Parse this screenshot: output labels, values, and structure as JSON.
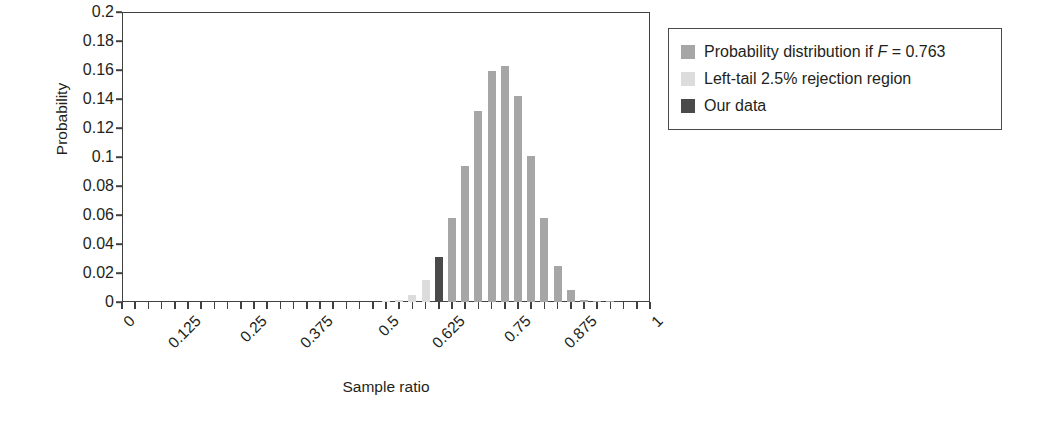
{
  "chart_data": {
    "type": "bar",
    "title": "",
    "xlabel": "Sample ratio",
    "ylabel": "Probability",
    "xlim": [
      0,
      1
    ],
    "ylim": [
      0,
      0.2
    ],
    "grid": false,
    "bar_width_ratio": 0.62,
    "x_tick_step": 0.025,
    "x_labeled_ticks": [
      "0",
      "0.125",
      "0.25",
      "0.375",
      "0.5",
      "0.625",
      "0.75",
      "0.875",
      "1"
    ],
    "x_labeled_values": [
      0,
      0.125,
      0.25,
      0.375,
      0.5,
      0.625,
      0.75,
      0.875,
      1
    ],
    "y_ticks": [
      "0.2",
      "0.18",
      "0.16",
      "0.14",
      "0.12",
      "0.1",
      "0.08",
      "0.06",
      "0.04",
      "0.02",
      "0"
    ],
    "y_tick_values": [
      0.2,
      0.18,
      0.16,
      0.14,
      0.12,
      0.1,
      0.08,
      0.06,
      0.04,
      0.02,
      0
    ],
    "colors": {
      "distribution": "#a6a6a6",
      "rejection": "#dcdcdc",
      "our_data": "#4a4a4a",
      "axis": "#404040",
      "text": "#231f20",
      "background": "#ffffff"
    },
    "legend": {
      "position": "right-top",
      "entries": [
        {
          "label_prefix": "Probability distribution if ",
          "label_italic": "F",
          "label_suffix": " = 0.763",
          "label_plain": "Probability distribution if F = 0.763",
          "color_key": "distribution"
        },
        {
          "label_prefix": "Left-tail 2.5% rejection region",
          "label_italic": "",
          "label_suffix": "",
          "label_plain": "Left-tail 2.5% rejection region",
          "color_key": "rejection"
        },
        {
          "label_prefix": "Our data",
          "label_italic": "",
          "label_suffix": "",
          "label_plain": "Our data",
          "color_key": "our_data"
        }
      ]
    },
    "x": [
      0.5,
      0.525,
      0.55,
      0.575,
      0.6,
      0.625,
      0.65,
      0.675,
      0.7,
      0.725,
      0.75,
      0.775,
      0.8,
      0.825,
      0.85,
      0.875,
      0.9,
      0.925
    ],
    "values": [
      0.0005,
      0.0015,
      0.005,
      0.015,
      0.031,
      0.058,
      0.094,
      0.132,
      0.159,
      0.163,
      0.142,
      0.101,
      0.058,
      0.025,
      0.008,
      0.0015,
      0.0005,
      0.0002
    ],
    "series_key": [
      "rejection",
      "rejection",
      "rejection",
      "rejection",
      "our_data",
      "distribution",
      "distribution",
      "distribution",
      "distribution",
      "distribution",
      "distribution",
      "distribution",
      "distribution",
      "distribution",
      "distribution",
      "distribution",
      "distribution",
      "distribution"
    ]
  }
}
